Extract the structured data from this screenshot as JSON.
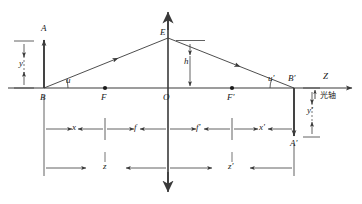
{
  "figure": {
    "type": "optics-ray-diagram",
    "colors": {
      "line": "#3a3a3a",
      "axis": "#3a3a3a",
      "background": "#ffffff",
      "text": "#1a1a1a"
    }
  },
  "axis": {
    "name": "Z",
    "label": "Z",
    "chinese_label": "光轴",
    "y": 88
  },
  "points": {
    "B": "B",
    "F": "F",
    "O": "O",
    "F_prime": "F'",
    "B_prime": "B'",
    "A": "A",
    "A_prime": "A'",
    "E": "E"
  },
  "angles": {
    "u": "u",
    "u_prime": "u'"
  },
  "heights": {
    "y": "y",
    "y_prime": "y'",
    "h": "h"
  },
  "distances": {
    "x": "x",
    "f": "f",
    "f_prime": "f'",
    "x_prime": "x'",
    "z": "z",
    "z_prime": "z'"
  },
  "geometry": {
    "axis_y": 88,
    "B_x": 44,
    "F_x": 105,
    "O_x": 168,
    "F_prime_x": 232,
    "B_prime_x": 294,
    "object_top_y": 42,
    "image_bottom_y": 136,
    "E_y": 38,
    "lens_top_y": 10,
    "lens_bottom_y": 190,
    "dim_row1_y": 127,
    "dim_row2_y": 165
  }
}
